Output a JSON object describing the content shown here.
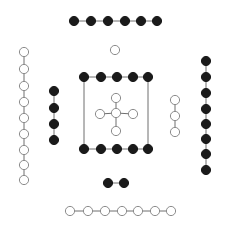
{
  "canvas": {
    "width": 230,
    "height": 226,
    "background": "#ffffff"
  },
  "style": {
    "filled_node_fill": "#1a1a1a",
    "filled_node_stroke": "#1a1a1a",
    "open_node_fill": "#ffffff",
    "open_node_stroke": "#8c8c8c",
    "edge_color": "#6e6e6e",
    "edge_width": 1,
    "node_stroke_width": 1,
    "node_radius_filled": 4.6,
    "node_radius_open": 4.6
  },
  "chart_data": {
    "type": "scatter",
    "title": "",
    "xlabel": "",
    "ylabel": "",
    "xlim": [
      0,
      230
    ],
    "ylim": [
      0,
      226
    ],
    "grid": false,
    "legend": "none",
    "components": [
      {
        "name": "top-filled-chain",
        "node_style": "filled",
        "node_count": 6,
        "nodes": [
          {
            "id": "t1",
            "x": 74,
            "y": 21
          },
          {
            "id": "t2",
            "x": 91,
            "y": 21
          },
          {
            "id": "t3",
            "x": 108,
            "y": 21
          },
          {
            "id": "t4",
            "x": 125,
            "y": 21
          },
          {
            "id": "t5",
            "x": 141,
            "y": 21
          },
          {
            "id": "t6",
            "x": 157,
            "y": 21
          }
        ],
        "edges": [
          [
            "t1",
            "t2"
          ],
          [
            "t2",
            "t3"
          ],
          [
            "t3",
            "t4"
          ],
          [
            "t4",
            "t5"
          ],
          [
            "t5",
            "t6"
          ]
        ]
      },
      {
        "name": "lone-open-node",
        "node_style": "open",
        "node_count": 1,
        "nodes": [
          {
            "id": "s1",
            "x": 115,
            "y": 50
          }
        ],
        "edges": []
      },
      {
        "name": "left-open-chain",
        "node_style": "open",
        "node_count": 9,
        "nodes": [
          {
            "id": "l1",
            "x": 24,
            "y": 52
          },
          {
            "id": "l2",
            "x": 24,
            "y": 69
          },
          {
            "id": "l3",
            "x": 24,
            "y": 86
          },
          {
            "id": "l4",
            "x": 24,
            "y": 102
          },
          {
            "id": "l5",
            "x": 24,
            "y": 118
          },
          {
            "id": "l6",
            "x": 24,
            "y": 134
          },
          {
            "id": "l7",
            "x": 24,
            "y": 150
          },
          {
            "id": "l8",
            "x": 24,
            "y": 165
          },
          {
            "id": "l9",
            "x": 24,
            "y": 180
          }
        ],
        "edges": [
          [
            "l1",
            "l2"
          ],
          [
            "l2",
            "l3"
          ],
          [
            "l3",
            "l4"
          ],
          [
            "l4",
            "l5"
          ],
          [
            "l5",
            "l6"
          ],
          [
            "l6",
            "l7"
          ],
          [
            "l7",
            "l8"
          ],
          [
            "l8",
            "l9"
          ]
        ]
      },
      {
        "name": "left-filled-chain",
        "node_style": "filled",
        "node_count": 4,
        "nodes": [
          {
            "id": "m1",
            "x": 54,
            "y": 91
          },
          {
            "id": "m2",
            "x": 54,
            "y": 108
          },
          {
            "id": "m3",
            "x": 54,
            "y": 124
          },
          {
            "id": "m4",
            "x": 54,
            "y": 140
          }
        ],
        "edges": [
          [
            "m1",
            "m2"
          ],
          [
            "m2",
            "m3"
          ],
          [
            "m3",
            "m4"
          ]
        ]
      },
      {
        "name": "center-rectangle-frame",
        "node_style": "filled",
        "node_count": 10,
        "nodes": [
          {
            "id": "a1",
            "x": 84,
            "y": 77
          },
          {
            "id": "a2",
            "x": 101,
            "y": 77
          },
          {
            "id": "a3",
            "x": 117,
            "y": 77
          },
          {
            "id": "a4",
            "x": 133,
            "y": 77
          },
          {
            "id": "a5",
            "x": 148,
            "y": 77
          },
          {
            "id": "b1",
            "x": 84,
            "y": 149
          },
          {
            "id": "b2",
            "x": 101,
            "y": 149
          },
          {
            "id": "b3",
            "x": 117,
            "y": 149
          },
          {
            "id": "b4",
            "x": 133,
            "y": 149
          },
          {
            "id": "b5",
            "x": 148,
            "y": 149
          }
        ],
        "edges": [
          [
            "a1",
            "a2"
          ],
          [
            "a2",
            "a3"
          ],
          [
            "a3",
            "a4"
          ],
          [
            "a4",
            "a5"
          ],
          [
            "b1",
            "b2"
          ],
          [
            "b2",
            "b3"
          ],
          [
            "b3",
            "b4"
          ],
          [
            "b4",
            "b5"
          ],
          [
            "a1",
            "b1"
          ],
          [
            "a5",
            "b5"
          ]
        ]
      },
      {
        "name": "center-plus-cluster",
        "node_style": "open",
        "node_count": 5,
        "nodes": [
          {
            "id": "c0",
            "x": 116,
            "y": 113
          },
          {
            "id": "cu",
            "x": 116,
            "y": 98
          },
          {
            "id": "cd",
            "x": 116,
            "y": 131
          },
          {
            "id": "cl",
            "x": 100,
            "y": 114
          },
          {
            "id": "cr",
            "x": 133,
            "y": 114
          }
        ],
        "edges": [
          [
            "c0",
            "cu"
          ],
          [
            "c0",
            "cd"
          ],
          [
            "c0",
            "cl"
          ],
          [
            "c0",
            "cr"
          ]
        ]
      },
      {
        "name": "right-open-chain",
        "node_style": "open",
        "node_count": 3,
        "nodes": [
          {
            "id": "r1",
            "x": 175,
            "y": 100
          },
          {
            "id": "r2",
            "x": 175,
            "y": 116
          },
          {
            "id": "r3",
            "x": 175,
            "y": 132
          }
        ],
        "edges": [
          [
            "r1",
            "r2"
          ],
          [
            "r2",
            "r3"
          ]
        ]
      },
      {
        "name": "far-right-filled-chain",
        "node_style": "filled",
        "node_count": 8,
        "nodes": [
          {
            "id": "f1",
            "x": 206,
            "y": 61
          },
          {
            "id": "f2",
            "x": 206,
            "y": 77
          },
          {
            "id": "f3",
            "x": 206,
            "y": 93
          },
          {
            "id": "f4",
            "x": 206,
            "y": 109
          },
          {
            "id": "f5",
            "x": 206,
            "y": 124
          },
          {
            "id": "f6",
            "x": 206,
            "y": 139
          },
          {
            "id": "f7",
            "x": 206,
            "y": 154
          },
          {
            "id": "f8",
            "x": 206,
            "y": 170
          }
        ],
        "edges": [
          [
            "f1",
            "f2"
          ],
          [
            "f2",
            "f3"
          ],
          [
            "f3",
            "f4"
          ],
          [
            "f4",
            "f5"
          ],
          [
            "f5",
            "f6"
          ],
          [
            "f6",
            "f7"
          ],
          [
            "f7",
            "f8"
          ]
        ]
      },
      {
        "name": "bottom-filled-pair",
        "node_style": "filled",
        "node_count": 2,
        "nodes": [
          {
            "id": "p1",
            "x": 108,
            "y": 183
          },
          {
            "id": "p2",
            "x": 124,
            "y": 183
          }
        ],
        "edges": [
          [
            "p1",
            "p2"
          ]
        ]
      },
      {
        "name": "bottom-open-chain",
        "node_style": "open",
        "node_count": 7,
        "nodes": [
          {
            "id": "q1",
            "x": 70,
            "y": 211
          },
          {
            "id": "q2",
            "x": 88,
            "y": 211
          },
          {
            "id": "q3",
            "x": 105,
            "y": 211
          },
          {
            "id": "q4",
            "x": 122,
            "y": 211
          },
          {
            "id": "q5",
            "x": 138,
            "y": 211
          },
          {
            "id": "q6",
            "x": 155,
            "y": 211
          },
          {
            "id": "q7",
            "x": 171,
            "y": 211
          }
        ],
        "edges": [
          [
            "q1",
            "q2"
          ],
          [
            "q2",
            "q3"
          ],
          [
            "q3",
            "q4"
          ],
          [
            "q4",
            "q5"
          ],
          [
            "q5",
            "q6"
          ],
          [
            "q6",
            "q7"
          ]
        ]
      }
    ]
  }
}
